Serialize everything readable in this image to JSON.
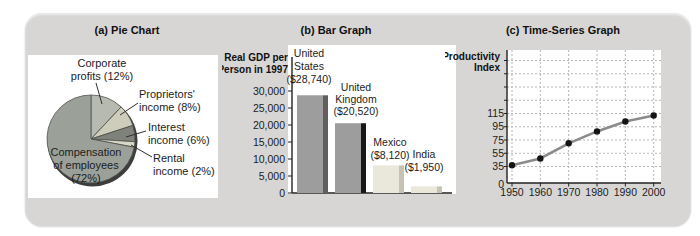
{
  "page": {
    "background": "#ffffff",
    "card_background": "#d7d6d4"
  },
  "chart_data": [
    {
      "type": "pie",
      "title": "(a) Pie Chart",
      "start": "12 o'clock, clockwise",
      "slices": [
        {
          "label": "Corporate profits",
          "pct": 12,
          "display_lines": [
            "Corporate",
            "profits (12%)"
          ],
          "color": "#b6bab0"
        },
        {
          "label": "Proprietors' income",
          "pct": 8,
          "display_lines": [
            "Proprietors'",
            "income (8%)"
          ],
          "color": "#cecdbb"
        },
        {
          "label": "Interest income",
          "pct": 6,
          "display_lines": [
            "Interest",
            "income (6%)"
          ],
          "color": "#7e827a"
        },
        {
          "label": "Rental income",
          "pct": 2,
          "display_lines": [
            "Rental",
            "income (2%)"
          ],
          "color": "#d9d7c8"
        },
        {
          "label": "Compensation of employees",
          "pct": 72,
          "display_lines": [
            "Compensation",
            "of employees",
            "(72%)"
          ],
          "color": "#9ba098"
        }
      ],
      "rim_color": "#3d3d3d"
    },
    {
      "type": "bar",
      "title": "(b) Bar Graph",
      "ylabel_lines": [
        "Real GDP per",
        "Person in 1997"
      ],
      "categories": [
        "United States",
        "United Kingdom",
        "Mexico",
        "India"
      ],
      "values": [
        28740,
        20520,
        8120,
        1950
      ],
      "bar_labels": [
        [
          "United",
          "States",
          "($28,740)"
        ],
        [
          "United",
          "Kingdom",
          "($20,520)"
        ],
        [
          "Mexico",
          "($8,120)"
        ],
        [
          "India",
          "($1,950)"
        ]
      ],
      "yticks": [
        0,
        5000,
        10000,
        15000,
        20000,
        25000,
        30000
      ],
      "ytick_labels": [
        "0",
        "5,000",
        "10,000",
        "15,000",
        "20,000",
        "25,000",
        "30,000"
      ],
      "ylim": [
        0,
        30000
      ],
      "bar_colors": [
        "#9d9d9d",
        "#9d9d9d",
        "#eae7db",
        "#eae7db"
      ],
      "bar_shadow_colors": [
        "#5f5f5f",
        "#181818",
        "#c6c3b5",
        "#c6c3b5"
      ]
    },
    {
      "type": "line",
      "title": "(c) Time-Series Graph",
      "ylabel_lines": [
        "Productivity",
        "Index"
      ],
      "x": [
        1950,
        1960,
        1970,
        1980,
        1990,
        2000
      ],
      "xtick_labels": [
        "1950",
        "1960",
        "1970",
        "1980",
        "1990",
        "2000"
      ],
      "values": [
        37,
        47,
        70,
        88,
        103,
        112
      ],
      "yticks": [
        0,
        35,
        55,
        75,
        95,
        115
      ],
      "ytick_labels": [
        "0",
        "35",
        "55",
        "75",
        "95",
        "115"
      ],
      "ygrid_values": [
        35,
        55,
        75,
        95,
        115,
        135,
        155,
        175,
        195
      ],
      "grid": "dashed",
      "line_color": "#8b8b8b",
      "point_color": "#141414"
    }
  ]
}
